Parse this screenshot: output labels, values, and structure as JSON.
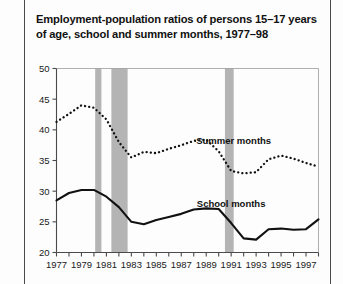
{
  "title": "Employment-population ratios of persons 15–17 years of age, school and summer months, 1977–98",
  "labels": {
    "summer": "Summer months",
    "school": "School months"
  },
  "colors": {
    "line": "#111111",
    "recession_band": "#b4b4b4",
    "axis": "#4a4a4a",
    "text": "#111111"
  },
  "chart_data": {
    "type": "line",
    "title": "Employment-population ratios of persons 15–17 years of age, school and summer months, 1977–98",
    "xlabel": "",
    "ylabel": "",
    "xlim": [
      1977,
      1998
    ],
    "ylim": [
      20,
      50
    ],
    "yticks": [
      20,
      25,
      30,
      35,
      40,
      45,
      50
    ],
    "ytick_labels": [
      "20",
      "25",
      "30",
      "35",
      "40",
      "45",
      "50"
    ],
    "xticks": [
      1977,
      1978,
      1979,
      1980,
      1981,
      1982,
      1983,
      1984,
      1985,
      1986,
      1987,
      1988,
      1989,
      1990,
      1991,
      1992,
      1993,
      1994,
      1995,
      1996,
      1997,
      1998
    ],
    "xtick_labels": [
      "1977",
      "",
      "1979",
      "",
      "1981",
      "",
      "1983",
      "",
      "1985",
      "",
      "1987",
      "",
      "1989",
      "",
      "1991",
      "",
      "1993",
      "",
      "1995",
      "",
      "1997",
      ""
    ],
    "grid": false,
    "legend_position": "inline-annotation",
    "x": [
      1977,
      1978,
      1979,
      1980,
      1981,
      1982,
      1983,
      1984,
      1985,
      1986,
      1987,
      1988,
      1989,
      1990,
      1991,
      1992,
      1993,
      1994,
      1995,
      1996,
      1997,
      1998
    ],
    "series": [
      {
        "name": "Summer months",
        "style": "dotted",
        "values": [
          41.3,
          42.6,
          44.0,
          43.6,
          41.7,
          38.0,
          35.5,
          36.4,
          36.2,
          36.9,
          37.5,
          38.2,
          38.4,
          36.5,
          33.3,
          32.9,
          33.1,
          35.2,
          35.8,
          35.3,
          34.6,
          34.0
        ]
      },
      {
        "name": "School months",
        "style": "solid",
        "values": [
          28.5,
          29.7,
          30.2,
          30.2,
          29.1,
          27.4,
          25.0,
          24.6,
          25.3,
          25.8,
          26.3,
          27.0,
          27.2,
          27.1,
          24.8,
          22.3,
          22.1,
          23.8,
          23.9,
          23.7,
          23.8,
          25.4
        ]
      }
    ],
    "recession_bands": [
      {
        "start": 1980.1,
        "end": 1980.6
      },
      {
        "start": 1981.4,
        "end": 1982.7
      },
      {
        "start": 1990.5,
        "end": 1991.2
      }
    ],
    "annotations": [
      {
        "text": "Summer months",
        "x": 1991.2,
        "y": 37.7
      },
      {
        "text": "School months",
        "x": 1991.0,
        "y": 27.5
      }
    ]
  }
}
